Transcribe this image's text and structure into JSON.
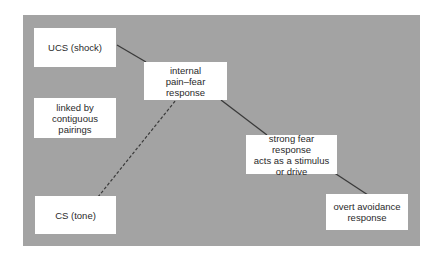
{
  "diagram": {
    "type": "flow",
    "background_color": "#a3a3a3",
    "box_color": "#ffffff",
    "line_color": "#3a3a3a",
    "nodes": [
      {
        "id": "ucs",
        "label": "UCS (shock)"
      },
      {
        "id": "internal",
        "label": "internal\npain–fear\nresponse"
      },
      {
        "id": "linked",
        "label": "linked by\ncontiguous\npairings"
      },
      {
        "id": "strong",
        "label": "strong fear response\nacts as a stimulus\nor drive"
      },
      {
        "id": "cs",
        "label": "CS (tone)"
      },
      {
        "id": "avoid",
        "label": "overt avoidance\nresponse"
      }
    ],
    "edges": [
      {
        "from": "ucs",
        "to": "internal",
        "style": "solid"
      },
      {
        "from": "cs",
        "to": "internal",
        "style": "dashed"
      },
      {
        "from": "internal",
        "to": "strong",
        "style": "solid"
      },
      {
        "from": "strong",
        "to": "avoid",
        "style": "solid"
      }
    ]
  }
}
